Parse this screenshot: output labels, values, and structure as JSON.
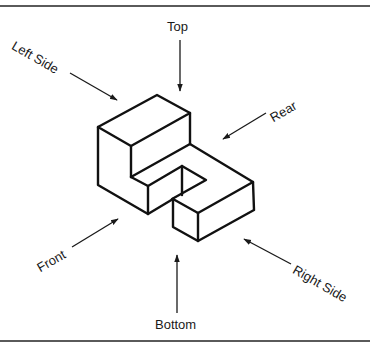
{
  "diagram": {
    "type": "isometric-view-directions",
    "labels": {
      "top": "Top",
      "bottom": "Bottom",
      "left_side": "Left Side",
      "right_side": "Right Side",
      "front": "Front",
      "rear": "Rear"
    },
    "colors": {
      "line": "#111111",
      "text": "#1a1a1a",
      "rule": "#5a5a5a",
      "background": "#ffffff"
    }
  }
}
